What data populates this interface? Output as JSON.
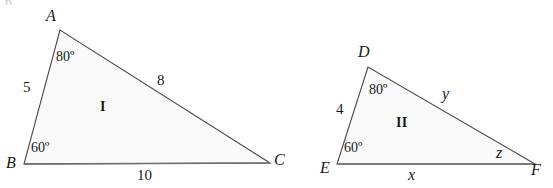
{
  "figure": {
    "canvas": {
      "width": 553,
      "height": 188
    },
    "style": {
      "stroke_color": "#4a4a52",
      "fill_color": "#fafafa",
      "baseline_color": "#6b6b73",
      "text_color": "#17171c",
      "background": "#ffffff",
      "stroke_width": 1.1
    },
    "triangles": [
      {
        "id": "triangle-1",
        "region_label": "I",
        "region_label_pos": {
          "x": 100,
          "y": 100
        },
        "vertices": [
          {
            "name": "A",
            "x": 60,
            "y": 30,
            "label_x": 46,
            "label_y": 8
          },
          {
            "name": "B",
            "x": 24,
            "y": 164,
            "label_x": 6,
            "label_y": 155
          },
          {
            "name": "C",
            "x": 270,
            "y": 163,
            "label_x": 274,
            "label_y": 152
          }
        ],
        "sides": [
          {
            "name": "side-AB",
            "label": "5",
            "label_x": 23,
            "label_y": 80
          },
          {
            "name": "side-AC",
            "label": "8",
            "label_x": 157,
            "label_y": 73
          },
          {
            "name": "side-BC",
            "label": "10",
            "label_x": 137,
            "label_y": 168
          }
        ],
        "angles": [
          {
            "name": "angle-A",
            "label": "80º",
            "label_x": 56,
            "label_y": 50
          },
          {
            "name": "angle-B",
            "label": "60º",
            "label_x": 31,
            "label_y": 141
          }
        ]
      },
      {
        "id": "triangle-2",
        "region_label": "II",
        "region_label_pos": {
          "x": 396,
          "y": 116
        },
        "vertices": [
          {
            "name": "D",
            "x": 368,
            "y": 67,
            "label_x": 358,
            "label_y": 44
          },
          {
            "name": "E",
            "x": 337,
            "y": 164,
            "label_x": 320,
            "label_y": 160
          },
          {
            "name": "F",
            "x": 535,
            "y": 164,
            "label_x": 531,
            "label_y": 162
          }
        ],
        "sides": [
          {
            "name": "side-DE",
            "label": "4",
            "label_x": 336,
            "label_y": 102
          },
          {
            "name": "side-DF",
            "label": "y",
            "label_x": 442,
            "label_y": 86
          },
          {
            "name": "side-EF",
            "label": "x",
            "label_x": 408,
            "label_y": 167
          }
        ],
        "angles": [
          {
            "name": "angle-D",
            "label": "80º",
            "label_x": 369,
            "label_y": 83
          },
          {
            "name": "angle-E",
            "label": "60º",
            "label_x": 344,
            "label_y": 141
          },
          {
            "name": "angle-F",
            "label": "z",
            "label_x": 496,
            "label_y": 145
          }
        ]
      }
    ]
  }
}
